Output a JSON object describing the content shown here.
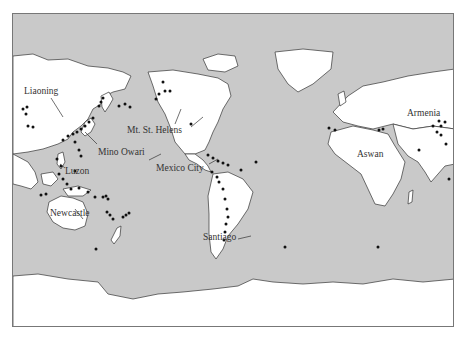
{
  "figure": {
    "type": "world-map",
    "colors": {
      "ocean": "#c9c9c9",
      "land": "#ffffff",
      "marker": "#111111",
      "border": "#777777"
    },
    "labels": [
      {
        "id": "liaoning",
        "text": "Liaoning",
        "x": 11,
        "y": 73
      },
      {
        "id": "mino-owari",
        "text": "Mino Owari",
        "x": 85,
        "y": 134
      },
      {
        "id": "luzon",
        "text": "Luzon",
        "x": 52,
        "y": 153
      },
      {
        "id": "newcastle",
        "text": "Newcastle",
        "x": 37,
        "y": 195
      },
      {
        "id": "mt-st-helens",
        "text": "Mt. St. Helens",
        "x": 114,
        "y": 112
      },
      {
        "id": "mexico-city",
        "text": "Mexico City",
        "x": 143,
        "y": 150
      },
      {
        "id": "santiago",
        "text": "Santiago",
        "x": 190,
        "y": 219
      },
      {
        "id": "armenia",
        "text": "Armenia",
        "x": 150,
        "y": 103,
        "region": "east"
      },
      {
        "id": "aswan",
        "text": "Aswan",
        "x": 100,
        "y": 145,
        "region": "east"
      }
    ]
  }
}
